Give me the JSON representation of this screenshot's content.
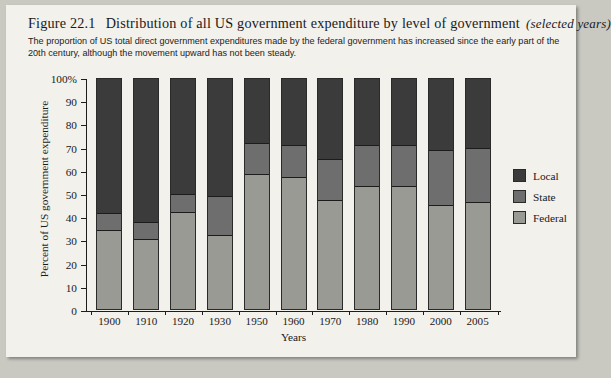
{
  "figure": {
    "number": "Figure 22.1",
    "title": "Distribution of all US government expenditure by level of government",
    "qualifier": "(selected years)",
    "subtitle": "The proportion of US total direct government expenditures made by the federal government has increased since the early part of the 20th century, although the movement upward has not been steady."
  },
  "legend": {
    "position": "right",
    "items": [
      {
        "label": "Local",
        "color": "#3b3b3b"
      },
      {
        "label": "State",
        "color": "#6e6e6e"
      },
      {
        "label": "Federal",
        "color": "#9a9a95"
      }
    ]
  },
  "chart_data": {
    "type": "bar",
    "stacked": true,
    "stack_total": 100,
    "title": "Distribution of all US government expenditure by level of government",
    "xlabel": "Years",
    "ylabel": "Percent of US government expenditure",
    "categories": [
      "1900",
      "1910",
      "1920",
      "1930",
      "1950",
      "1960",
      "1970",
      "1980",
      "1990",
      "2000",
      "2005"
    ],
    "ylim": [
      0,
      100
    ],
    "yticks": [
      0,
      10,
      20,
      30,
      40,
      50,
      60,
      70,
      80,
      90,
      100
    ],
    "ytick_labels": [
      "0",
      "10",
      "20",
      "30",
      "40",
      "50",
      "60",
      "70",
      "80",
      "90",
      "100%"
    ],
    "grid": false,
    "series": [
      {
        "name": "Federal",
        "color": "#9a9a95",
        "values": [
          34,
          30,
          42,
          32,
          58,
          57,
          47,
          53,
          53,
          45,
          46
        ]
      },
      {
        "name": "State",
        "color": "#6e6e6e",
        "values": [
          8,
          8,
          8,
          17,
          14,
          14,
          18,
          18,
          18,
          24,
          24
        ]
      },
      {
        "name": "Local",
        "color": "#3b3b3b",
        "values": [
          58,
          62,
          50,
          51,
          28,
          29,
          35,
          29,
          29,
          31,
          30
        ]
      }
    ]
  }
}
